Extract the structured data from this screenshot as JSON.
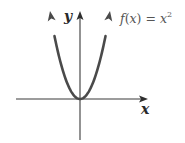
{
  "chart_data": {
    "type": "line",
    "title": "",
    "function": "f(x) = x^2",
    "series": [
      {
        "name": "f(x) = x^2",
        "x": [
          -3,
          -2.5,
          -2,
          -1.5,
          -1,
          -0.5,
          0,
          0.5,
          1,
          1.5,
          2,
          2.5,
          3
        ],
        "values": [
          9,
          6.25,
          4,
          2.25,
          1,
          0.25,
          0,
          0.25,
          1,
          2.25,
          4,
          6.25,
          9
        ]
      }
    ],
    "xlabel": "x",
    "ylabel": "y",
    "xlim": [
      -6.4,
      6.7
    ],
    "ylim": [
      -4.1,
      9
    ],
    "grid": false,
    "legend": "none",
    "annotations": [
      {
        "text": "f(x) = x²",
        "position": "upper-right of curve"
      }
    ],
    "tick_labels": false,
    "arrows": {
      "x_axis": "positive end",
      "y_axis": "positive end",
      "curve": "both ends (upward)"
    }
  },
  "labels": {
    "y_axis": "y",
    "x_axis": "x",
    "function_prefix": "f",
    "function_paren_open": "(",
    "function_var": "x",
    "function_paren_close": ")",
    "function_eq": " = ",
    "function_base": "x",
    "function_exp": "2"
  },
  "colors": {
    "axis": "#3a3a3a",
    "curve": "#4a4a4a",
    "text": "#2a2a2a",
    "background": "#ffffff"
  }
}
